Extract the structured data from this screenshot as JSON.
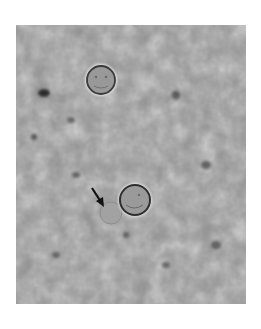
{
  "image": {
    "description": "Brightfield micrograph showing two round cysts on a mottled gray background; an arrow points to a faint ghost cell near the lower cyst",
    "background_color": "#8e8e8e",
    "frame": {
      "x": 16,
      "y": 25,
      "width": 230,
      "height": 279
    },
    "cysts": [
      {
        "label": "upper-cyst",
        "cx": 85,
        "cy": 55,
        "r": 14
      },
      {
        "label": "lower-cyst",
        "cx": 119,
        "cy": 175,
        "r": 15
      }
    ],
    "ghost_cell": {
      "cx": 95,
      "cy": 188,
      "r": 11
    },
    "arrow": {
      "x1": 76,
      "y1": 163,
      "x2": 87,
      "y2": 180,
      "color": "#111111"
    },
    "dark_spots": [
      {
        "cx": 28,
        "cy": 68,
        "rx": 6,
        "ry": 4
      },
      {
        "cx": 160,
        "cy": 70,
        "rx": 4,
        "ry": 4
      },
      {
        "cx": 18,
        "cy": 112,
        "rx": 3,
        "ry": 3
      },
      {
        "cx": 55,
        "cy": 95,
        "rx": 4,
        "ry": 3
      },
      {
        "cx": 190,
        "cy": 140,
        "rx": 5,
        "ry": 4
      },
      {
        "cx": 200,
        "cy": 220,
        "rx": 5,
        "ry": 4
      },
      {
        "cx": 60,
        "cy": 150,
        "rx": 4,
        "ry": 3
      },
      {
        "cx": 110,
        "cy": 210,
        "rx": 3,
        "ry": 3
      },
      {
        "cx": 150,
        "cy": 240,
        "rx": 4,
        "ry": 3
      },
      {
        "cx": 40,
        "cy": 230,
        "rx": 4,
        "ry": 3
      }
    ]
  }
}
